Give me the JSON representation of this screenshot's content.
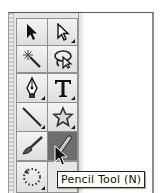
{
  "toolbar": {
    "groups": [
      {
        "tools": [
          {
            "name": "Selection Tool",
            "icon": "selection-arrow-icon",
            "flyout": false
          },
          {
            "name": "Direct Selection Tool",
            "icon": "direct-selection-arrow-icon",
            "flyout": true
          },
          {
            "name": "Magic Wand Tool",
            "icon": "magic-wand-icon",
            "flyout": false
          },
          {
            "name": "Lasso Tool",
            "icon": "lasso-icon",
            "flyout": false
          }
        ]
      },
      {
        "tools": [
          {
            "name": "Pen Tool",
            "icon": "pen-icon",
            "flyout": true
          },
          {
            "name": "Type Tool",
            "icon": "type-icon",
            "glyph": "T",
            "flyout": true
          },
          {
            "name": "Line Segment Tool",
            "icon": "line-segment-icon",
            "flyout": true
          },
          {
            "name": "Star Tool",
            "icon": "star-icon",
            "flyout": true
          },
          {
            "name": "Paintbrush Tool",
            "icon": "paintbrush-icon",
            "flyout": false
          },
          {
            "name": "Pencil Tool",
            "icon": "pencil-icon",
            "flyout": false,
            "selected": true
          }
        ]
      },
      {
        "tools": [
          {
            "name": "Rotate Tool",
            "icon": "rotate-icon",
            "flyout": true
          }
        ]
      }
    ],
    "selected_color": "#6e6e6e"
  },
  "tooltip": {
    "text": "Pencil Tool (N)"
  }
}
